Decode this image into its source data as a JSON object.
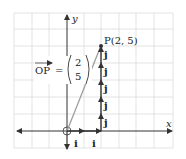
{
  "diagram": {
    "axes": {
      "x_label": "x",
      "y_label": "y"
    },
    "point": {
      "label": "P(2, 5)",
      "x": 2,
      "y": 5
    },
    "vector": {
      "name": "OP",
      "equals": "=",
      "components": [
        "2",
        "5"
      ]
    },
    "unit_vectors": {
      "i_label": "i",
      "j_label": "j"
    },
    "i_steps": 2,
    "j_steps": 5,
    "colors": {
      "axis": "#333333",
      "grid": "#dcdcdc",
      "vector_op": "#999999"
    }
  }
}
